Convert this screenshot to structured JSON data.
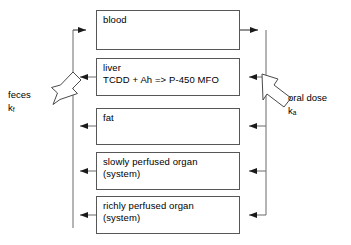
{
  "diagram": {
    "type": "flow-diagram",
    "style": {
      "box_stroke": "#575757",
      "connector_stroke": "#404040",
      "hollow_arrow_stroke": "#4a4a4a",
      "background": "#ffffff",
      "text_color": "#000000"
    },
    "compartments": [
      {
        "id": "blood",
        "lines": [
          "blood"
        ],
        "x": 96,
        "y": 10,
        "width": 144,
        "height": 40
      },
      {
        "id": "liver",
        "lines": [
          "liver",
          "TCDD + Ah => P-450 MFO"
        ],
        "x": 96,
        "y": 58,
        "width": 144,
        "height": 38
      },
      {
        "id": "fat",
        "lines": [
          "fat"
        ],
        "x": 96,
        "y": 108,
        "width": 144,
        "height": 37
      },
      {
        "id": "slowly-perfused-organ",
        "lines": [
          "slowly perfused organ",
          "(system)"
        ],
        "x": 96,
        "y": 152,
        "width": 144,
        "height": 38
      },
      {
        "id": "richly-perfused-organ",
        "lines": [
          "richly perfused organ",
          "(system)"
        ],
        "x": 96,
        "y": 196,
        "width": 144,
        "height": 38
      }
    ],
    "side_labels": [
      {
        "id": "feces",
        "text": "feces",
        "rate_symbol": "k",
        "rate_subscript": "f",
        "x": 8,
        "y": 89,
        "side": "left"
      },
      {
        "id": "oral-dose",
        "text": "oral dose",
        "rate_symbol": "k",
        "rate_subscript": "a",
        "x": 288,
        "y": 92,
        "side": "right"
      }
    ],
    "connectors": {
      "left_bus_x": 73,
      "right_bus_x": 266,
      "left_description": "Venous return bus: liver, fat, slowly perfused organ and richly perfused organ outflow left to a shared vertical line that feeds back into blood.",
      "right_description": "Arterial supply bus: blood outflow right to a shared vertical line that distributes into liver, fat, slowly perfused organ and richly perfused organ."
    },
    "hollow_arrows": [
      {
        "id": "feces-elimination-arrow",
        "direction": "down-left",
        "from": [
          80,
          70
        ],
        "to": [
          45,
          114
        ]
      },
      {
        "id": "oral-dose-input-arrow",
        "direction": "up-left",
        "from": [
          297,
          121
        ],
        "to": [
          261,
          77
        ]
      }
    ]
  }
}
